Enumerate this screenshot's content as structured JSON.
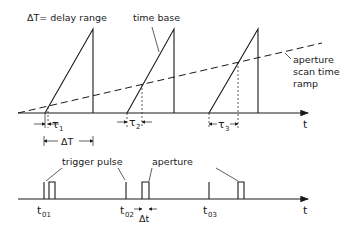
{
  "diagram": {
    "labels": {
      "delay_range": "ΔT= delay range",
      "time_base": "time base",
      "aperture_scan_line1": "aperture",
      "aperture_scan_line2": "scan time",
      "aperture_scan_line3": "ramp",
      "trigger_pulse": "trigger pulse",
      "aperture": "aperture",
      "axis_t_upper": "t",
      "axis_t_lower": "t",
      "tau1": "τ",
      "tau1_sub": "1",
      "tau2": "τ",
      "tau2_sub": "2",
      "tau3": "τ",
      "tau3_sub": "3",
      "delta_T": "ΔT",
      "delta_t": "Δt",
      "t01": "t",
      "t01_sub": "01",
      "t02": "t",
      "t02_sub": "02",
      "t03": "t",
      "t03_sub": "03"
    },
    "colors": {
      "ink": "#1a1a1a",
      "background": "#ffffff"
    }
  }
}
